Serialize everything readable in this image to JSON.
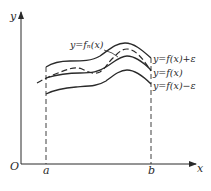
{
  "diagram": {
    "type": "uniform-convergence-band",
    "axes": {
      "x_label": "x",
      "y_label": "y",
      "origin_label": "O",
      "ticks": [
        {
          "label": "a",
          "x": 46
        },
        {
          "label": "b",
          "x": 151
        }
      ]
    },
    "curves": [
      {
        "name": "f-plus-eps",
        "label": "y=f(x)+ε",
        "style": "solid",
        "points": [
          [
            46,
            67
          ],
          [
            60,
            62
          ],
          [
            90,
            60
          ],
          [
            110,
            48
          ],
          [
            125,
            43
          ],
          [
            140,
            50
          ],
          [
            151,
            58
          ]
        ]
      },
      {
        "name": "f",
        "label": "y=f(x)",
        "style": "solid",
        "points": [
          [
            46,
            78
          ],
          [
            75,
            73
          ],
          [
            100,
            72
          ],
          [
            115,
            62
          ],
          [
            127,
            56
          ],
          [
            151,
            70
          ]
        ]
      },
      {
        "name": "f-minus-eps",
        "label": "y=f(x)−ε",
        "style": "solid",
        "points": [
          [
            46,
            94
          ],
          [
            60,
            88
          ],
          [
            95,
            86
          ],
          [
            112,
            76
          ],
          [
            127,
            70
          ],
          [
            151,
            84
          ]
        ]
      },
      {
        "name": "fn",
        "label": "y=fₙ(x)",
        "style": "dashed",
        "points": [
          [
            37,
            83
          ],
          [
            50,
            76
          ],
          [
            62,
            72
          ],
          [
            80,
            68
          ],
          [
            90,
            73
          ],
          [
            100,
            74
          ],
          [
            112,
            58
          ],
          [
            125,
            49
          ],
          [
            140,
            56
          ],
          [
            150,
            70
          ]
        ]
      }
    ],
    "labels": {
      "fn": "y=fₙ(x)",
      "f_plus": "y=f(x)+ε",
      "f": "y=f(x)",
      "f_minus": "y=f(x)−ε"
    },
    "colors": {
      "line": "#2a2a2a",
      "background": "#ffffff"
    }
  }
}
